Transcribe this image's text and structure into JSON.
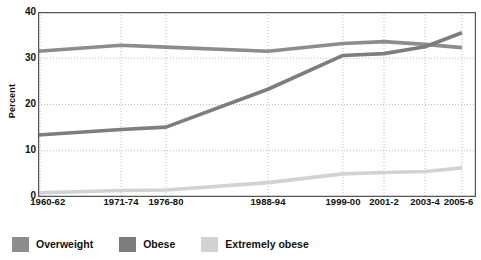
{
  "chart_data": {
    "type": "line",
    "title": "",
    "subtitle": "",
    "xlabel": "",
    "ylabel": "Percent",
    "ylim": [
      0,
      40
    ],
    "yticks": [
      0,
      10,
      20,
      30,
      40
    ],
    "grid": true,
    "legend_position": "bottom-left",
    "categories": [
      "1960-62",
      "1971-74",
      "1976-80",
      "1988-94",
      "1999-00",
      "2001-2",
      "2003-4",
      "2005-6"
    ],
    "series": [
      {
        "name": "Overweight",
        "color": "#8c8c8c",
        "values": [
          31.5,
          32.8,
          32.4,
          31.5,
          33.2,
          33.6,
          33.0,
          32.3
        ]
      },
      {
        "name": "Obese",
        "color": "#7d7d7d",
        "values": [
          13.4,
          14.6,
          15.1,
          23.3,
          30.6,
          31.0,
          32.5,
          35.5
        ]
      },
      {
        "name": "Extremely obese",
        "color": "#d2d2d2",
        "values": [
          0.9,
          1.4,
          1.5,
          3.1,
          5.0,
          5.3,
          5.5,
          6.3
        ]
      }
    ]
  },
  "axis": {
    "y_label": "Percent",
    "y_tick_0": "0",
    "y_tick_1": "10",
    "y_tick_2": "20",
    "y_tick_3": "30",
    "y_tick_4": "40"
  },
  "xlabels": {
    "t0": "1960-62",
    "t1": "1971-74",
    "t2": "1976-80",
    "t3": "1988-94",
    "t4": "1999-00",
    "t5": "2001-2",
    "t6": "2003-4",
    "t7": "2005-6"
  },
  "legend": {
    "items": [
      {
        "label": "Overweight",
        "color": "#8c8c8c"
      },
      {
        "label": "Obese",
        "color": "#7d7d7d"
      },
      {
        "label": "Extremely obese",
        "color": "#d2d2d2"
      }
    ]
  },
  "colors": {
    "axis": "#555555",
    "grid": "#bdbdbd",
    "text": "#111111",
    "background": "#ffffff"
  }
}
